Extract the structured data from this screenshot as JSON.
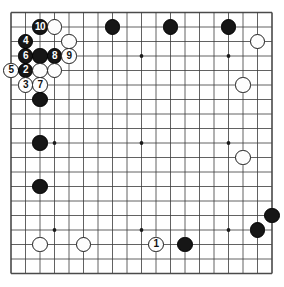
{
  "diagram": {
    "board": {
      "type": "go-board",
      "size": 19,
      "grid_lines": 19,
      "origin_x": 11,
      "origin_y": 12.5,
      "spacing": 14.5,
      "star_points": [
        {
          "col": 3,
          "row": 3
        },
        {
          "col": 9,
          "row": 3
        },
        {
          "col": 15,
          "row": 3
        },
        {
          "col": 3,
          "row": 9
        },
        {
          "col": 9,
          "row": 9
        },
        {
          "col": 15,
          "row": 9
        },
        {
          "col": 3,
          "row": 15
        },
        {
          "col": 9,
          "row": 15
        },
        {
          "col": 15,
          "row": 15
        }
      ],
      "border_color": "#4a4a4a",
      "line_color": "#3a3a3a",
      "background": "#ffffff",
      "stone_radius": 7.6
    },
    "stones": [
      {
        "col": 2,
        "row": 1,
        "color": "black",
        "label": "10"
      },
      {
        "col": 3,
        "row": 1,
        "color": "white",
        "label": ""
      },
      {
        "col": 7,
        "row": 1,
        "color": "black",
        "label": ""
      },
      {
        "col": 11,
        "row": 1,
        "color": "black",
        "label": ""
      },
      {
        "col": 15,
        "row": 1,
        "color": "black",
        "label": ""
      },
      {
        "col": 1,
        "row": 2,
        "color": "black",
        "label": "4"
      },
      {
        "col": 4,
        "row": 2,
        "color": "white",
        "label": ""
      },
      {
        "col": 17,
        "row": 2,
        "color": "white",
        "label": ""
      },
      {
        "col": 1,
        "row": 3,
        "color": "black",
        "label": "6"
      },
      {
        "col": 2,
        "row": 3,
        "color": "black",
        "label": ""
      },
      {
        "col": 3,
        "row": 3,
        "color": "black",
        "label": "8"
      },
      {
        "col": 4,
        "row": 3,
        "color": "white",
        "label": "9"
      },
      {
        "col": 0,
        "row": 4,
        "color": "white",
        "label": "5"
      },
      {
        "col": 1,
        "row": 4,
        "color": "black",
        "label": "2"
      },
      {
        "col": 2,
        "row": 4,
        "color": "white",
        "label": ""
      },
      {
        "col": 3,
        "row": 4,
        "color": "white",
        "label": ""
      },
      {
        "col": 1,
        "row": 5,
        "color": "white",
        "label": "3"
      },
      {
        "col": 2,
        "row": 5,
        "color": "white",
        "label": "7"
      },
      {
        "col": 16,
        "row": 5,
        "color": "white",
        "label": ""
      },
      {
        "col": 2,
        "row": 6,
        "color": "black",
        "label": ""
      },
      {
        "col": 2,
        "row": 9,
        "color": "black",
        "label": ""
      },
      {
        "col": 16,
        "row": 10,
        "color": "white",
        "label": ""
      },
      {
        "col": 2,
        "row": 12,
        "color": "black",
        "label": ""
      },
      {
        "col": 18,
        "row": 14,
        "color": "black",
        "label": ""
      },
      {
        "col": 17,
        "row": 15,
        "color": "black",
        "label": ""
      },
      {
        "col": 2,
        "row": 16,
        "color": "white",
        "label": ""
      },
      {
        "col": 5,
        "row": 16,
        "color": "white",
        "label": ""
      },
      {
        "col": 10,
        "row": 16,
        "color": "white",
        "label": "1"
      },
      {
        "col": 12,
        "row": 16,
        "color": "black",
        "label": ""
      }
    ]
  }
}
